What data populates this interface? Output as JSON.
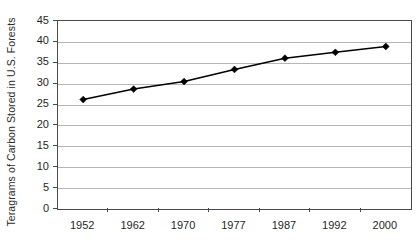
{
  "chart_data": {
    "type": "line",
    "title": "",
    "subtitle": "",
    "xlabel": "",
    "ylabel": "Teragrams of Carbon Stored in U.S. Forests",
    "categories": [
      "1952",
      "1962",
      "1970",
      "1977",
      "1987",
      "1992",
      "2000"
    ],
    "values": [
      26.2,
      28.7,
      30.5,
      33.4,
      36.1,
      37.5,
      38.9
    ],
    "series": [
      {
        "name": "Carbon stored in U.S. forests",
        "values": [
          26.2,
          28.7,
          30.5,
          33.4,
          36.1,
          37.5,
          38.9
        ]
      }
    ],
    "ylim": [
      0,
      45
    ],
    "ytick_labels": [
      "0",
      "5",
      "10",
      "15",
      "20",
      "25",
      "30",
      "35",
      "40",
      "45"
    ],
    "ytick_values": [
      0,
      5,
      10,
      15,
      20,
      25,
      30,
      35,
      40,
      45
    ],
    "xtick_labels": [
      "1952",
      "1962",
      "1970",
      "1977",
      "1987",
      "1992",
      "2000"
    ],
    "grid": "horizontal",
    "legend": "none",
    "marker": "diamond",
    "line_color": "#000000",
    "marker_color": "#000000",
    "gridline_color": "#b6b6b6",
    "axis_color": "#4a4a4a",
    "background_color": "#ffffff",
    "annotations": []
  }
}
